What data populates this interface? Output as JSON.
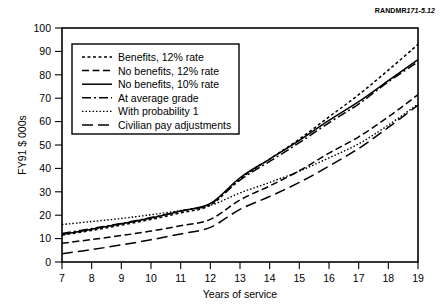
{
  "figure": {
    "source_id_prefix": "RANDMR",
    "source_id_number": "171-5.12"
  },
  "chart_data": {
    "type": "line",
    "title": "",
    "xlabel": "Years of service",
    "ylabel": "FY91 $ 000s",
    "xlim": [
      7,
      19
    ],
    "ylim": [
      0,
      100
    ],
    "xticks": [
      7,
      8,
      9,
      10,
      11,
      12,
      13,
      14,
      15,
      16,
      17,
      18,
      19
    ],
    "yticks": [
      0,
      10,
      20,
      30,
      40,
      50,
      60,
      70,
      80,
      90,
      100
    ],
    "xtick_labels": [
      "7",
      "8",
      "9",
      "10",
      "11",
      "12",
      "13",
      "14",
      "15",
      "16",
      "17",
      "18",
      "19"
    ],
    "ytick_labels": [
      "0",
      "10",
      "20",
      "30",
      "40",
      "50",
      "60",
      "70",
      "80",
      "90",
      "100"
    ],
    "grid": false,
    "legend_position": "upper left",
    "x": [
      7,
      8,
      9,
      10,
      11,
      12,
      13,
      14,
      15,
      16,
      17,
      18,
      19
    ],
    "series": [
      {
        "name": "Benefits, 12% rate",
        "dash": "3,2.5",
        "width": 1.5,
        "values": [
          11.5,
          13.5,
          15.8,
          18.2,
          21.0,
          24.3,
          35.5,
          44.0,
          52.5,
          62.0,
          71.5,
          82.0,
          93.0
        ]
      },
      {
        "name": "No benefits, 12% rate",
        "dash": "7,3.5",
        "width": 1.5,
        "values": [
          8.0,
          9.6,
          11.3,
          13.2,
          15.5,
          18.2,
          26.5,
          32.5,
          39.0,
          46.5,
          53.5,
          62.0,
          71.5
        ]
      },
      {
        "name": "No benefits, 10% rate",
        "dash": "none",
        "width": 1.5,
        "values": [
          11.8,
          14.0,
          16.3,
          18.8,
          21.8,
          25.0,
          36.0,
          44.0,
          52.0,
          60.5,
          68.5,
          77.5,
          86.5
        ]
      },
      {
        "name": "At average grade",
        "dash": "9,3,2,3",
        "width": 1.5,
        "values": [
          12.2,
          14.3,
          16.5,
          19.0,
          21.8,
          24.8,
          35.0,
          43.0,
          51.0,
          59.5,
          67.5,
          77.0,
          85.5
        ]
      },
      {
        "name": "With probability 1",
        "dash": "1.5,2",
        "width": 1.4,
        "values": [
          16.0,
          17.3,
          18.6,
          20.2,
          22.0,
          24.2,
          29.5,
          34.0,
          38.8,
          44.5,
          50.5,
          58.5,
          67.5
        ]
      },
      {
        "name": "Civilian pay adjustments",
        "dash": "11,5",
        "width": 1.5,
        "values": [
          3.5,
          5.3,
          7.3,
          9.5,
          12.0,
          14.8,
          22.5,
          28.0,
          34.0,
          41.0,
          48.5,
          57.5,
          67.0
        ]
      }
    ]
  },
  "legend": {
    "items": [
      "Benefits, 12% rate",
      "No benefits, 12% rate",
      "No benefits, 10% rate",
      "At average grade",
      "With probability 1",
      "Civilian pay adjustments"
    ]
  }
}
